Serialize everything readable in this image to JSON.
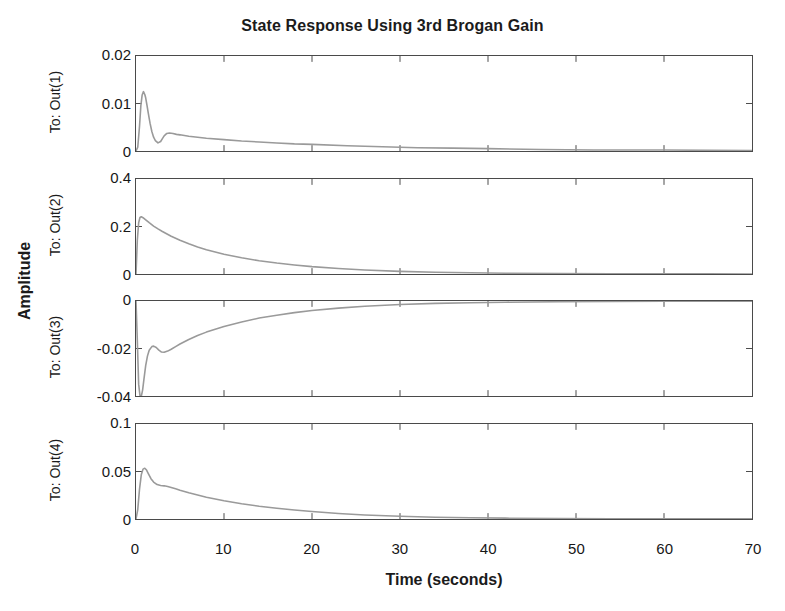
{
  "chart_data": {
    "type": "line",
    "title": "State Response Using 3rd Brogan Gain",
    "xlabel": "Time (seconds)",
    "ylabel": "Amplitude",
    "grid": false,
    "legend": "none",
    "xlim": [
      0,
      70
    ],
    "xticks": [
      "0",
      "10",
      "20",
      "30",
      "40",
      "50",
      "60",
      "70"
    ],
    "xtick_values": [
      0,
      10,
      20,
      30,
      40,
      50,
      60,
      70
    ],
    "line_color": "#9a9a9a",
    "axis_color": "#4a4a4a",
    "subplots": [
      {
        "name": "To: Out(1)",
        "ylim": [
          0,
          0.02
        ],
        "yticks": [
          "0",
          "0.01",
          "0.02"
        ],
        "ytick_values": [
          0,
          0.01,
          0.02
        ],
        "x": [
          0,
          0.2,
          0.4,
          0.55,
          0.7,
          0.85,
          1.0,
          1.1,
          1.25,
          1.4,
          1.6,
          1.8,
          2.0,
          2.2,
          2.5,
          2.8,
          3.0,
          3.2,
          3.5,
          3.8,
          4.2,
          4.6,
          5.0,
          6.0,
          7.0,
          8.0,
          10.0,
          12.0,
          14.0,
          16.0,
          18.0,
          20.0,
          24.0,
          28.0,
          32.0,
          36.0,
          40.0,
          46.0,
          52.0,
          60.0,
          70.0
        ],
        "y": [
          0,
          0.0008,
          0.0052,
          0.0095,
          0.0118,
          0.0125,
          0.0119,
          0.0112,
          0.0096,
          0.0079,
          0.0058,
          0.0041,
          0.0029,
          0.0022,
          0.0017,
          0.002,
          0.0026,
          0.0032,
          0.0037,
          0.0038,
          0.0037,
          0.0035,
          0.0034,
          0.0031,
          0.0029,
          0.0027,
          0.0024,
          0.0021,
          0.0019,
          0.0017,
          0.0015,
          0.0014,
          0.0011,
          0.0009,
          0.0007,
          0.0006,
          0.0005,
          0.0003,
          0.0002,
          0.0002,
          0.0001
        ]
      },
      {
        "name": "To: Out(2)",
        "ylim": [
          0,
          0.4
        ],
        "yticks": [
          "0",
          "0.2",
          "0.4"
        ],
        "ytick_values": [
          0,
          0.2,
          0.4
        ],
        "x": [
          0,
          0.15,
          0.3,
          0.45,
          0.6,
          0.8,
          1.0,
          1.5,
          2.0,
          2.5,
          3.0,
          4.0,
          5.0,
          6.0,
          7.0,
          8.0,
          10.0,
          12.0,
          14.0,
          16.0,
          18.0,
          20.0,
          23.0,
          26.0,
          30.0,
          34.0,
          38.0,
          42.0,
          48.0,
          54.0,
          60.0,
          65.0,
          70.0
        ],
        "y": [
          0,
          0.142,
          0.215,
          0.238,
          0.241,
          0.237,
          0.231,
          0.216,
          0.202,
          0.19,
          0.179,
          0.159,
          0.142,
          0.127,
          0.114,
          0.102,
          0.083,
          0.068,
          0.056,
          0.046,
          0.038,
          0.031,
          0.023,
          0.017,
          0.011,
          0.0075,
          0.005,
          0.0034,
          0.0019,
          0.0011,
          0.0006,
          0.0004,
          0.0003
        ]
      },
      {
        "name": "To: Out(3)",
        "ylim": [
          -0.04,
          0
        ],
        "yticks": [
          "0",
          "-0.02",
          "-0.04"
        ],
        "ytick_values": [
          0,
          -0.02,
          -0.04
        ],
        "x": [
          0,
          0.15,
          0.3,
          0.45,
          0.6,
          0.75,
          0.9,
          1.1,
          1.3,
          1.5,
          1.8,
          2.0,
          2.3,
          2.6,
          2.9,
          3.2,
          3.6,
          4.0,
          4.5,
          5.0,
          6.0,
          7.0,
          8.0,
          10.0,
          12.0,
          14.0,
          16.0,
          18.0,
          20.0,
          23.0,
          26.0,
          30.0,
          34.0,
          38.0,
          42.0,
          48.0,
          54.0,
          60.0,
          70.0
        ],
        "y": [
          0,
          -0.0165,
          -0.035,
          -0.0398,
          -0.0402,
          -0.0375,
          -0.033,
          -0.0272,
          -0.0232,
          -0.0207,
          -0.0192,
          -0.019,
          -0.0196,
          -0.0207,
          -0.0215,
          -0.0216,
          -0.0211,
          -0.0203,
          -0.0192,
          -0.0181,
          -0.0162,
          -0.0145,
          -0.0131,
          -0.0107,
          -0.0088,
          -0.0072,
          -0.006,
          -0.0049,
          -0.004,
          -0.003,
          -0.0022,
          -0.0015,
          -0.001,
          -0.0007,
          -0.0005,
          -0.0003,
          -0.0002,
          -0.0001,
          -5e-05
        ]
      },
      {
        "name": "To: Out(4)",
        "ylim": [
          0,
          0.1
        ],
        "yticks": [
          "0",
          "0.05",
          "0.1"
        ],
        "ytick_values": [
          0,
          0.05,
          0.1
        ],
        "x": [
          0,
          0.2,
          0.4,
          0.6,
          0.8,
          1.0,
          1.2,
          1.4,
          1.7,
          2.0,
          2.4,
          2.8,
          3.2,
          3.6,
          4.0,
          4.5,
          5.0,
          6.0,
          7.0,
          8.0,
          10.0,
          12.0,
          14.0,
          16.0,
          18.0,
          20.0,
          23.0,
          26.0,
          30.0,
          34.0,
          38.0,
          42.0,
          48.0,
          54.0,
          60.0,
          65.0,
          70.0
        ],
        "y": [
          0,
          0.01,
          0.0315,
          0.0465,
          0.0525,
          0.0535,
          0.0515,
          0.0478,
          0.0424,
          0.0389,
          0.0362,
          0.0352,
          0.0349,
          0.0342,
          0.0332,
          0.0318,
          0.0303,
          0.0276,
          0.0252,
          0.023,
          0.0192,
          0.0161,
          0.0135,
          0.0113,
          0.0094,
          0.0078,
          0.0058,
          0.0043,
          0.0028,
          0.0019,
          0.0013,
          0.0009,
          0.0005,
          0.0003,
          0.0002,
          0.00015,
          0.0001
        ]
      }
    ]
  }
}
